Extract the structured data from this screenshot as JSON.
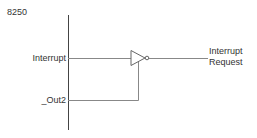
{
  "diagram": {
    "title": "8250",
    "inputs": {
      "interrupt": "Interrupt",
      "out2": "_Out2"
    },
    "gate": "inverter-with-enable",
    "output": {
      "line1": "Interrupt",
      "line2": "Request"
    }
  }
}
